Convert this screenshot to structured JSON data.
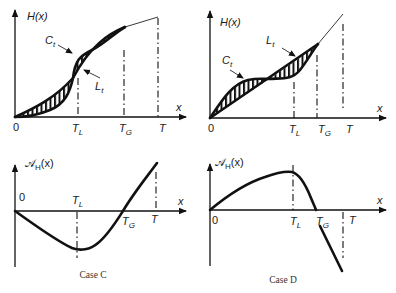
{
  "panels": [
    {
      "id": "case-c-top",
      "y_label": "H(x)",
      "x_label": "x",
      "origin_label": "0",
      "ticks": [
        {
          "main": "T",
          "sub": "L"
        },
        {
          "main": "T",
          "sub": "G"
        },
        {
          "main": "T",
          "sub": ""
        }
      ],
      "curve_labels": [
        {
          "main": "C",
          "sub": "t"
        },
        {
          "main": "L",
          "sub": "t"
        }
      ]
    },
    {
      "id": "case-d-top",
      "y_label": "H(x)",
      "x_label": "x",
      "origin_label": "0",
      "ticks": [
        {
          "main": "T",
          "sub": "L"
        },
        {
          "main": "T",
          "sub": "G"
        },
        {
          "main": "T",
          "sub": ""
        }
      ],
      "curve_labels": [
        {
          "main": "C",
          "sub": "t"
        },
        {
          "main": "L",
          "sub": "t"
        }
      ]
    },
    {
      "id": "case-c-bottom",
      "y_label_script": "𝒜",
      "y_label_sub": "H",
      "y_label_arg": "(x)",
      "x_label": "x",
      "origin_label": "0",
      "ticks": [
        {
          "main": "T",
          "sub": "L"
        },
        {
          "main": "T",
          "sub": "G"
        },
        {
          "main": "T",
          "sub": ""
        }
      ],
      "caption": "Case C"
    },
    {
      "id": "case-d-bottom",
      "y_label_script": "𝒜",
      "y_label_sub": "H",
      "y_label_arg": "(x)",
      "x_label": "x",
      "origin_label": "0",
      "ticks": [
        {
          "main": "T",
          "sub": "L"
        },
        {
          "main": "T",
          "sub": "G"
        },
        {
          "main": "T",
          "sub": ""
        }
      ],
      "caption": "Case D"
    }
  ]
}
